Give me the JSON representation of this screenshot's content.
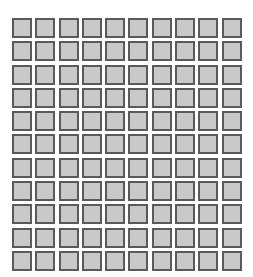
{
  "canvas": {
    "width": 253,
    "height": 277,
    "background_color": "#ffffff"
  },
  "grid": {
    "name": "square-tile-grid",
    "rows": 11,
    "columns": 10,
    "total_cells": 110,
    "origin_x": 12,
    "origin_y": 18,
    "cell_pitch_x": 23.3,
    "cell_pitch_y": 23.3,
    "cell_size": 20,
    "cell_gap": 3.3,
    "cell_fill_color": "#c9c9c9",
    "cell_border_color": "#5a5a5a",
    "cell_border_width": 2,
    "cells": [
      [
        1,
        1,
        1,
        1,
        1,
        1,
        1,
        1,
        1,
        1
      ],
      [
        1,
        1,
        1,
        1,
        1,
        1,
        1,
        1,
        1,
        1
      ],
      [
        1,
        1,
        1,
        1,
        1,
        1,
        1,
        1,
        1,
        1
      ],
      [
        1,
        1,
        1,
        1,
        1,
        1,
        1,
        1,
        1,
        1
      ],
      [
        1,
        1,
        1,
        1,
        1,
        1,
        1,
        1,
        1,
        1
      ],
      [
        1,
        1,
        1,
        1,
        1,
        1,
        1,
        1,
        1,
        1
      ],
      [
        1,
        1,
        1,
        1,
        1,
        1,
        1,
        1,
        1,
        1
      ],
      [
        1,
        1,
        1,
        1,
        1,
        1,
        1,
        1,
        1,
        1
      ],
      [
        1,
        1,
        1,
        1,
        1,
        1,
        1,
        1,
        1,
        1
      ],
      [
        1,
        1,
        1,
        1,
        1,
        1,
        1,
        1,
        1,
        1
      ],
      [
        1,
        1,
        1,
        1,
        1,
        1,
        1,
        1,
        1,
        1
      ]
    ]
  }
}
